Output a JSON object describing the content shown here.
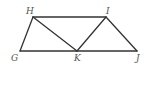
{
  "diagram": {
    "points": {
      "H": {
        "label": "H",
        "x": 33,
        "y": 17,
        "lx": 26,
        "ly": 14
      },
      "I": {
        "label": "I",
        "x": 106,
        "y": 17,
        "lx": 106,
        "ly": 14
      },
      "G": {
        "label": "G",
        "x": 20,
        "y": 51,
        "lx": 11,
        "ly": 61
      },
      "K": {
        "label": "K",
        "x": 77,
        "y": 51,
        "lx": 74,
        "ly": 61
      },
      "J": {
        "label": "J",
        "x": 137,
        "y": 51,
        "lx": 136,
        "ly": 61
      }
    },
    "segments": [
      [
        "H",
        "I"
      ],
      [
        "G",
        "J"
      ],
      [
        "G",
        "H"
      ],
      [
        "H",
        "K"
      ],
      [
        "K",
        "I"
      ],
      [
        "I",
        "J"
      ]
    ],
    "colors": {
      "line": "#333333",
      "label": "#555555",
      "background": "#ffffff"
    }
  }
}
